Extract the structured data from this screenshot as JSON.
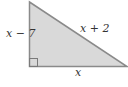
{
  "diagram": {
    "type": "right-triangle",
    "fill_color": "#d9d9d9",
    "stroke_color": "#8a8a8a",
    "labels": {
      "left_leg": "x − 7",
      "hypotenuse": "x + 2",
      "base": "x"
    },
    "right_angle_marker": "bottom-left"
  }
}
